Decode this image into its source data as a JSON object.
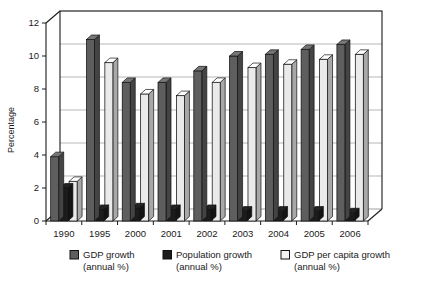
{
  "chart_data": {
    "type": "bar",
    "title": "",
    "xlabel": "",
    "ylabel": "Percentage",
    "ylim": [
      0,
      12
    ],
    "yticks": [
      0,
      2,
      4,
      6,
      8,
      10,
      12
    ],
    "grid": true,
    "legend_position": "bottom",
    "categories": [
      "1990",
      "1995",
      "2000",
      "2001",
      "2002",
      "2003",
      "2004",
      "2005",
      "2006"
    ],
    "series": [
      {
        "name": "GDP growth (annual %)",
        "color": "#5e5e5e",
        "values": [
          3.9,
          11.0,
          8.4,
          8.4,
          9.1,
          10.0,
          10.1,
          10.4,
          10.7
        ]
      },
      {
        "name": "Population growth (annual %)",
        "color": "#1c1c1c",
        "values": [
          2.0,
          0.7,
          0.8,
          0.7,
          0.7,
          0.6,
          0.6,
          0.6,
          0.5
        ]
      },
      {
        "name": "GDP per capita growth (annual %)",
        "color": "#eaeaea",
        "values": [
          2.4,
          9.6,
          7.7,
          7.6,
          8.4,
          9.3,
          9.5,
          9.8,
          10.1
        ]
      }
    ]
  },
  "axis": {
    "y_label": "Percentage",
    "y_ticks": [
      "0",
      "2",
      "4",
      "6",
      "8",
      "10",
      "12"
    ],
    "x_ticks": [
      "1990",
      "1995",
      "2000",
      "2001",
      "2002",
      "2003",
      "2004",
      "2005",
      "2006"
    ]
  },
  "legend": {
    "items": [
      {
        "label_line1": "GDP growth",
        "label_line2": "(annual %)",
        "swatch": "#5e5e5e"
      },
      {
        "label_line1": "Population growth",
        "label_line2": "(annual %)",
        "swatch": "#1c1c1c"
      },
      {
        "label_line1": "GDP per capita growth",
        "label_line2": "(annual %)",
        "swatch": "#f2f2f2"
      }
    ]
  }
}
